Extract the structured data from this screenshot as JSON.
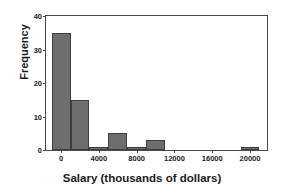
{
  "chart_data": {
    "type": "bar",
    "title": "",
    "xlabel": "Salary (thousands of dollars)",
    "ylabel": "Frequency",
    "xlim": [
      -1600,
      21800
    ],
    "ylim": [
      0,
      40
    ],
    "grid": false,
    "legend": null,
    "bin_width": 2000,
    "bins": [
      {
        "left": -1000,
        "right": 1000,
        "center": 0,
        "value": 35
      },
      {
        "left": 1000,
        "right": 3000,
        "center": 2000,
        "value": 15
      },
      {
        "left": 3000,
        "right": 5000,
        "center": 4000,
        "value": 1
      },
      {
        "left": 5000,
        "right": 7000,
        "center": 6000,
        "value": 5
      },
      {
        "left": 7000,
        "right": 9000,
        "center": 8000,
        "value": 1
      },
      {
        "left": 9000,
        "right": 11000,
        "center": 10000,
        "value": 3
      },
      {
        "left": 11000,
        "right": 13000,
        "center": 12000,
        "value": 0
      },
      {
        "left": 13000,
        "right": 15000,
        "center": 14000,
        "value": 0
      },
      {
        "left": 15000,
        "right": 17000,
        "center": 16000,
        "value": 0
      },
      {
        "left": 17000,
        "right": 19000,
        "center": 18000,
        "value": 0
      },
      {
        "left": 19000,
        "right": 21000,
        "center": 20000,
        "value": 1
      }
    ],
    "categories": [
      "0",
      "2000",
      "4000",
      "6000",
      "8000",
      "10000",
      "12000",
      "14000",
      "16000",
      "18000",
      "20000"
    ],
    "values": [
      35,
      15,
      1,
      5,
      1,
      3,
      0,
      0,
      0,
      0,
      1
    ],
    "xticks": [
      {
        "value": 0,
        "label": "0"
      },
      {
        "value": 4000,
        "label": "4000"
      },
      {
        "value": 8000,
        "label": "8000"
      },
      {
        "value": 12000,
        "label": "12000"
      },
      {
        "value": 16000,
        "label": "16000"
      },
      {
        "value": 20000,
        "label": "20000"
      }
    ],
    "yticks": [
      {
        "value": 0,
        "label": "0"
      },
      {
        "value": 10,
        "label": "10"
      },
      {
        "value": 20,
        "label": "20"
      },
      {
        "value": 30,
        "label": "30"
      },
      {
        "value": 40,
        "label": "40"
      }
    ],
    "colors": {
      "bar_fill": "#6e6e6e",
      "bar_edge": "#3d3d3d",
      "axis": "#4a4a4a",
      "text": "#1a1a1a",
      "background": "#ffffff"
    }
  }
}
